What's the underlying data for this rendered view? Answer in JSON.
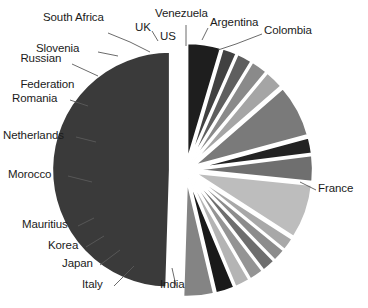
{
  "chart_data": {
    "type": "pie",
    "title": "",
    "subtitle": "",
    "xlabel": "",
    "ylabel": "",
    "legend_position": "none",
    "grid": false,
    "exploded": true,
    "start_angle_deg": -90,
    "direction": "counterclockwise",
    "categories": [
      "France",
      "Colombia",
      "Argentina",
      "Venezuela",
      "US",
      "UK",
      "South Africa",
      "Slovenia",
      "Russian Federation",
      "Romania",
      "Netherlands",
      "Morocco",
      "Mauritius",
      "Korea",
      "Japan",
      "Italy",
      "India"
    ],
    "values": [
      49.5,
      4.2,
      2.6,
      2.1,
      2.0,
      1.9,
      1.8,
      1.8,
      7.5,
      3.6,
      2.2,
      7.2,
      2.6,
      2.3,
      2.1,
      2.0,
      4.6
    ],
    "value_unit": "percent",
    "colors": [
      "#3a3a3a",
      "#848484",
      "#1a1a1a",
      "#b4b4b4",
      "#949494",
      "#6e6e6e",
      "#8c8c8c",
      "#a8a8a8",
      "#bdbdbd",
      "#6f6f6f",
      "#232323",
      "#7a7a7a",
      "#a5a5a5",
      "#8a8a8a",
      "#5f5f5f",
      "#414141",
      "#1e1e1e"
    ]
  },
  "labels": [
    {
      "id": "south-africa",
      "text": "South Africa"
    },
    {
      "id": "uk",
      "text": "UK"
    },
    {
      "id": "venezuela",
      "text": "Venezuela"
    },
    {
      "id": "argentina",
      "text": "Argentina"
    },
    {
      "id": "colombia",
      "text": "Colombia"
    },
    {
      "id": "us",
      "text": "US"
    },
    {
      "id": "russian-federation",
      "text": "Russian\nFederation"
    },
    {
      "id": "slovenia",
      "text": "Slovenia"
    },
    {
      "id": "romania",
      "text": "Romania"
    },
    {
      "id": "netherlands",
      "text": "Netherlands"
    },
    {
      "id": "morocco",
      "text": "Morocco"
    },
    {
      "id": "mauritius",
      "text": "Mauritius"
    },
    {
      "id": "korea",
      "text": "Korea"
    },
    {
      "id": "japan",
      "text": "Japan"
    },
    {
      "id": "italy",
      "text": "Italy"
    },
    {
      "id": "india",
      "text": "India"
    },
    {
      "id": "france",
      "text": "France"
    }
  ],
  "label_text": {
    "south_africa": "South Africa",
    "uk": "UK",
    "us": "US",
    "venezuela": "Venezuela",
    "argentina": "Argentina",
    "colombia": "Colombia",
    "russian_federation_line1": "Russian",
    "russian_federation_line2": "Federation",
    "slovenia": "Slovenia",
    "romania": "Romania",
    "netherlands": "Netherlands",
    "morocco": "Morocco",
    "mauritius": "Mauritius",
    "korea": "Korea",
    "japan": "Japan",
    "italy": "Italy",
    "india": "India",
    "france": "France"
  },
  "style": {
    "background": "#ffffff",
    "text_color": "#1b1b1b",
    "leader_color": "#5a5a5a"
  }
}
